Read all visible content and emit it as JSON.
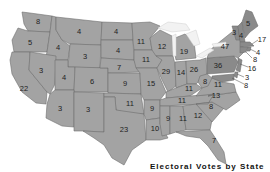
{
  "map": {
    "title": "US electoral votes by state",
    "fill_color": "#a3a3a3",
    "dark_fill_color": "#8a8a8a",
    "border_color": "#6e6e6e",
    "states": [
      {
        "abbr": "WA",
        "votes": "8"
      },
      {
        "abbr": "OR",
        "votes": "5"
      },
      {
        "abbr": "CA",
        "votes": "22"
      },
      {
        "abbr": "ID",
        "votes": "4"
      },
      {
        "abbr": "NV",
        "votes": "3"
      },
      {
        "abbr": "MT",
        "votes": "4"
      },
      {
        "abbr": "WY",
        "votes": "3"
      },
      {
        "abbr": "UT",
        "votes": "4"
      },
      {
        "abbr": "CO",
        "votes": "6"
      },
      {
        "abbr": "AZ",
        "votes": "3"
      },
      {
        "abbr": "NM",
        "votes": "3"
      },
      {
        "abbr": "ND",
        "votes": "4"
      },
      {
        "abbr": "SD",
        "votes": "4"
      },
      {
        "abbr": "NE",
        "votes": "7"
      },
      {
        "abbr": "KS",
        "votes": "9"
      },
      {
        "abbr": "OK",
        "votes": "11"
      },
      {
        "abbr": "TX",
        "votes": "23"
      },
      {
        "abbr": "MN",
        "votes": "11"
      },
      {
        "abbr": "IA",
        "votes": "11"
      },
      {
        "abbr": "MO",
        "votes": "15"
      },
      {
        "abbr": "AR",
        "votes": "9"
      },
      {
        "abbr": "LA",
        "votes": "10"
      },
      {
        "abbr": "WI",
        "votes": "12"
      },
      {
        "abbr": "IL",
        "votes": "29"
      },
      {
        "abbr": "MI",
        "votes": "19"
      },
      {
        "abbr": "IN",
        "votes": "14"
      },
      {
        "abbr": "OH",
        "votes": "26"
      },
      {
        "abbr": "KY",
        "votes": "11"
      },
      {
        "abbr": "TN",
        "votes": "11"
      },
      {
        "abbr": "MS",
        "votes": "9"
      },
      {
        "abbr": "AL",
        "votes": "11"
      },
      {
        "abbr": "GA",
        "votes": "12"
      },
      {
        "abbr": "FL",
        "votes": "7"
      },
      {
        "abbr": "SC",
        "votes": "8"
      },
      {
        "abbr": "NC",
        "votes": "13"
      },
      {
        "abbr": "VA",
        "votes": "11"
      },
      {
        "abbr": "WV",
        "votes": "8"
      },
      {
        "abbr": "PA",
        "votes": "36"
      },
      {
        "abbr": "NY",
        "votes": "47"
      },
      {
        "abbr": "VT",
        "votes": "3"
      },
      {
        "abbr": "NH",
        "votes": "4"
      },
      {
        "abbr": "ME",
        "votes": "5"
      },
      {
        "abbr": "MA",
        "votes": "17"
      },
      {
        "abbr": "RI",
        "votes": "4"
      },
      {
        "abbr": "CT",
        "votes": "8"
      },
      {
        "abbr": "NJ",
        "votes": "16"
      },
      {
        "abbr": "DE",
        "votes": "3"
      },
      {
        "abbr": "MD",
        "votes": "8"
      }
    ]
  },
  "caption": {
    "text": "Electoral Votes by State"
  }
}
